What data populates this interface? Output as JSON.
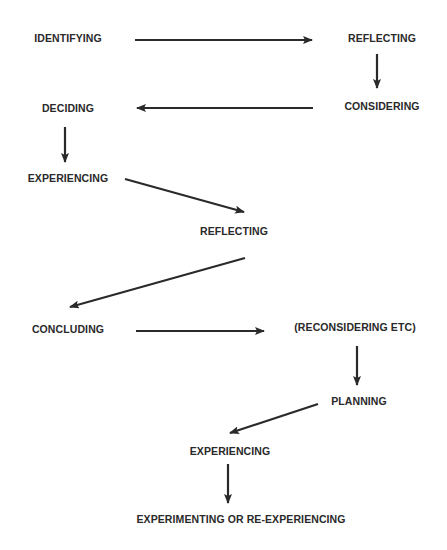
{
  "diagram": {
    "type": "flow",
    "nodes": [
      {
        "id": "n1",
        "label": "IDENTIFYING",
        "x": 68,
        "y": 38
      },
      {
        "id": "n2",
        "label": "REFLECTING",
        "x": 382,
        "y": 38
      },
      {
        "id": "n3",
        "label": "CONSIDERING",
        "x": 382,
        "y": 106
      },
      {
        "id": "n4",
        "label": "DECIDING",
        "x": 68,
        "y": 108
      },
      {
        "id": "n5",
        "label": "EXPERIENCING",
        "x": 68,
        "y": 178
      },
      {
        "id": "n6",
        "label": "REFLECTING",
        "x": 234,
        "y": 231
      },
      {
        "id": "n7",
        "label": "CONCLUDING",
        "x": 68,
        "y": 329
      },
      {
        "id": "n8",
        "label": "(RECONSIDERING ETC)",
        "x": 355,
        "y": 327
      },
      {
        "id": "n9",
        "label": "PLANNING",
        "x": 359,
        "y": 401
      },
      {
        "id": "n10",
        "label": "EXPERIENCING",
        "x": 230,
        "y": 451
      },
      {
        "id": "n11",
        "label": "EXPERIMENTING OR RE-EXPERIENCING",
        "x": 241,
        "y": 519
      }
    ],
    "edges": [
      {
        "from": "n1",
        "to": "n2",
        "x1": 135,
        "y1": 40,
        "x2": 312,
        "y2": 40
      },
      {
        "from": "n2",
        "to": "n3",
        "x1": 377,
        "y1": 54,
        "x2": 377,
        "y2": 88
      },
      {
        "from": "n3",
        "to": "n4",
        "x1": 313,
        "y1": 108,
        "x2": 137,
        "y2": 108
      },
      {
        "from": "n4",
        "to": "n5",
        "x1": 65,
        "y1": 127,
        "x2": 65,
        "y2": 162
      },
      {
        "from": "n5",
        "to": "n6",
        "x1": 125,
        "y1": 179,
        "x2": 244,
        "y2": 212
      },
      {
        "from": "n6",
        "to": "n7",
        "x1": 245,
        "y1": 258,
        "x2": 70,
        "y2": 307
      },
      {
        "from": "n7",
        "to": "n8",
        "x1": 136,
        "y1": 331,
        "x2": 264,
        "y2": 331
      },
      {
        "from": "n8",
        "to": "n9",
        "x1": 357,
        "y1": 346,
        "x2": 357,
        "y2": 385
      },
      {
        "from": "n9",
        "to": "n10",
        "x1": 318,
        "y1": 404,
        "x2": 230,
        "y2": 433
      },
      {
        "from": "n10",
        "to": "n11",
        "x1": 228,
        "y1": 464,
        "x2": 228,
        "y2": 503
      }
    ],
    "colors": {
      "text": "#2a2a2a",
      "arrow": "#2a2a2a",
      "background": "#ffffff"
    }
  }
}
